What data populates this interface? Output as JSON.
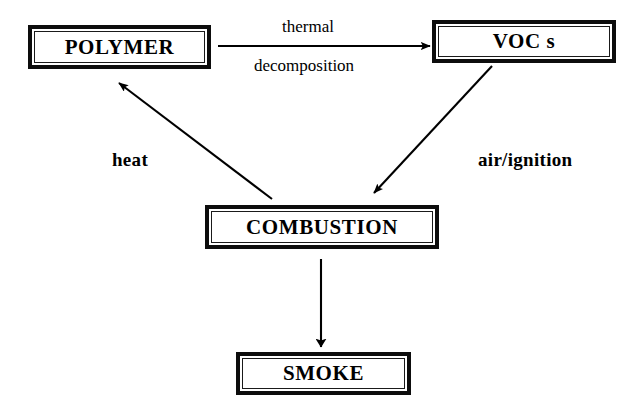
{
  "diagram": {
    "background_color": "#ffffff",
    "stroke_color": "#000000",
    "nodes": [
      {
        "id": "polymer",
        "label": "POLYMER"
      },
      {
        "id": "vocs",
        "label": "VOC s"
      },
      {
        "id": "combustion",
        "label": "COMBUSTION"
      },
      {
        "id": "smoke",
        "label": "SMOKE"
      }
    ],
    "edges": [
      {
        "id": "polymer-to-vocs",
        "from": "polymer",
        "to": "vocs",
        "label_line1": "thermal",
        "label_line2": "decomposition",
        "style": "plain",
        "direction": "horizontal-right"
      },
      {
        "id": "vocs-to-combustion",
        "from": "vocs",
        "to": "combustion",
        "label": "air/ignition",
        "style": "bold",
        "direction": "diagonal-down-left"
      },
      {
        "id": "combustion-to-polymer",
        "from": "combustion",
        "to": "polymer",
        "label": "heat",
        "style": "bold",
        "direction": "diagonal-up-left"
      },
      {
        "id": "combustion-to-smoke",
        "from": "combustion",
        "to": "smoke",
        "label": "",
        "style": "plain",
        "direction": "vertical-down"
      }
    ]
  }
}
